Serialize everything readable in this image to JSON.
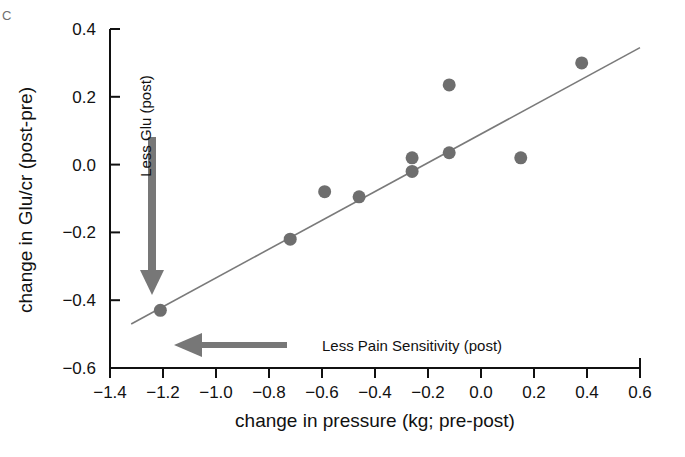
{
  "figure": {
    "panel_letter": "C"
  },
  "chart_data": {
    "type": "scatter",
    "title": "",
    "xlabel": "change in pressure (kg; pre-post)",
    "ylabel": "change in Glu/cr (post-pre)",
    "xlim": [
      -1.4,
      0.6
    ],
    "ylim": [
      -0.6,
      0.4
    ],
    "xticks": [
      -1.4,
      -1.2,
      -1.0,
      -0.8,
      -0.6,
      -0.4,
      -0.2,
      0.0,
      0.2,
      0.4,
      0.6
    ],
    "xtick_labels": [
      "−1.4",
      "−1.2",
      "−1.0",
      "−0.8",
      "−0.6",
      "−0.4",
      "−0.2",
      "0.0",
      "0.2",
      "0.4",
      "0.6"
    ],
    "yticks": [
      -0.6,
      -0.4,
      -0.2,
      0.0,
      0.2,
      0.4
    ],
    "ytick_labels": [
      "−0.6",
      "−0.4",
      "−0.2",
      "0.0",
      "0.2",
      "0.4"
    ],
    "grid": false,
    "legend": false,
    "marker_color": "#6e6e6e",
    "marker_size": 13,
    "points": [
      {
        "x": -1.21,
        "y": -0.43
      },
      {
        "x": -0.72,
        "y": -0.22
      },
      {
        "x": -0.59,
        "y": -0.08
      },
      {
        "x": -0.46,
        "y": -0.095
      },
      {
        "x": -0.26,
        "y": 0.02
      },
      {
        "x": -0.26,
        "y": -0.02
      },
      {
        "x": -0.12,
        "y": 0.235
      },
      {
        "x": -0.12,
        "y": 0.035
      },
      {
        "x": 0.15,
        "y": 0.02
      },
      {
        "x": 0.38,
        "y": 0.3
      }
    ],
    "fit_line": {
      "type": "linear",
      "x_start": -1.32,
      "y_start": -0.47,
      "x_end": 0.6,
      "y_end": 0.345,
      "color": "#7a7a7a"
    },
    "annotations": [
      {
        "name": "less-glu-arrow",
        "text": "Less Glu (post)",
        "direction": "down",
        "orientation": "vertical",
        "color": "#777777",
        "label_rotation": -90
      },
      {
        "name": "less-pain-sensitivity-arrow",
        "text": "Less Pain Sensitivity (post)",
        "direction": "left",
        "orientation": "horizontal",
        "color": "#777777",
        "label_rotation": 0
      }
    ]
  }
}
